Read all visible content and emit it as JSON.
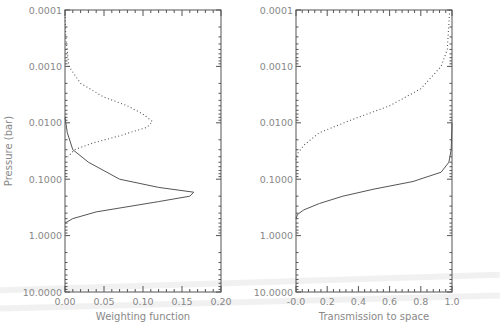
{
  "chart_data": [
    {
      "type": "line",
      "panel": "left",
      "title": "",
      "xlabel": "Weighting function",
      "ylabel": "Pressure (bar)",
      "xlim": [
        0.0,
        0.2
      ],
      "ylim": [
        10.0,
        0.0001
      ],
      "yscale": "log",
      "xticks": [
        "0.00",
        "0.05",
        "0.10",
        "0.15",
        "0.20"
      ],
      "yticks": [
        "0.0001",
        "0.0010",
        "0.0100",
        "0.1000",
        "1.0000",
        "10.0000"
      ],
      "grid": false,
      "series": [
        {
          "name": "dotted",
          "style": "dotted",
          "points": [
            [
              0.0,
              0.0001
            ],
            [
              0.001,
              0.0003
            ],
            [
              0.005,
              0.001
            ],
            [
              0.02,
              0.002
            ],
            [
              0.05,
              0.0035
            ],
            [
              0.08,
              0.005
            ],
            [
              0.1,
              0.007
            ],
            [
              0.112,
              0.0095
            ],
            [
              0.105,
              0.012
            ],
            [
              0.07,
              0.017
            ],
            [
              0.035,
              0.023
            ],
            [
              0.012,
              0.03
            ],
            [
              0.004,
              0.04
            ]
          ]
        },
        {
          "name": "solid",
          "style": "solid",
          "points": [
            [
              0.0,
              0.008
            ],
            [
              0.003,
              0.015
            ],
            [
              0.01,
              0.03
            ],
            [
              0.03,
              0.05
            ],
            [
              0.07,
              0.1
            ],
            [
              0.12,
              0.14
            ],
            [
              0.165,
              0.17
            ],
            [
              0.16,
              0.2
            ],
            [
              0.12,
              0.25
            ],
            [
              0.04,
              0.38
            ],
            [
              0.01,
              0.5
            ],
            [
              0.0,
              0.6
            ]
          ]
        }
      ]
    },
    {
      "type": "line",
      "panel": "right",
      "title": "",
      "xlabel": "Transmission to space",
      "ylabel": "",
      "xlim": [
        0.0,
        1.0
      ],
      "ylim": [
        10.0,
        0.0001
      ],
      "yscale": "log",
      "xticks": [
        "-0.0",
        "0.2",
        "0.4",
        "0.6",
        "0.8",
        "1.0"
      ],
      "yticks": [
        "0.0001",
        "0.0010",
        "0.0100",
        "0.1000",
        "1.0000",
        "10.0000"
      ],
      "grid": false,
      "series": [
        {
          "name": "dotted",
          "style": "dotted",
          "points": [
            [
              0.985,
              0.0001
            ],
            [
              0.97,
              0.0005
            ],
            [
              0.93,
              0.001
            ],
            [
              0.8,
              0.0025
            ],
            [
              0.6,
              0.005
            ],
            [
              0.35,
              0.009
            ],
            [
              0.15,
              0.015
            ],
            [
              0.05,
              0.025
            ],
            [
              0.01,
              0.035
            ],
            [
              0.0,
              0.045
            ]
          ]
        },
        {
          "name": "solid",
          "style": "solid",
          "points": [
            [
              1.0,
              0.01
            ],
            [
              0.995,
              0.03
            ],
            [
              0.98,
              0.05
            ],
            [
              0.93,
              0.075
            ],
            [
              0.75,
              0.11
            ],
            [
              0.5,
              0.15
            ],
            [
              0.3,
              0.2
            ],
            [
              0.15,
              0.27
            ],
            [
              0.05,
              0.35
            ],
            [
              0.01,
              0.42
            ],
            [
              0.0,
              0.5
            ]
          ]
        }
      ]
    }
  ],
  "panels": {
    "left": {
      "xlabel": "Weighting function",
      "ylabel": "Pressure (bar)",
      "xticks": [
        "0.00",
        "0.05",
        "0.10",
        "0.15",
        "0.20"
      ],
      "yticks": [
        "0.0001",
        "0.0010",
        "0.0100",
        "0.1000",
        "1.0000",
        "10.0000"
      ]
    },
    "right": {
      "xlabel": "Transmission to space",
      "xticks": [
        "-0.0",
        "0.2",
        "0.4",
        "0.6",
        "0.8",
        "1.0"
      ],
      "yticks": [
        "0.0001",
        "0.0010",
        "0.0100",
        "0.1000",
        "1.0000",
        "10.0000"
      ]
    }
  },
  "colors": {
    "axis": "#555555",
    "line": "#555555",
    "text": "#888888"
  }
}
